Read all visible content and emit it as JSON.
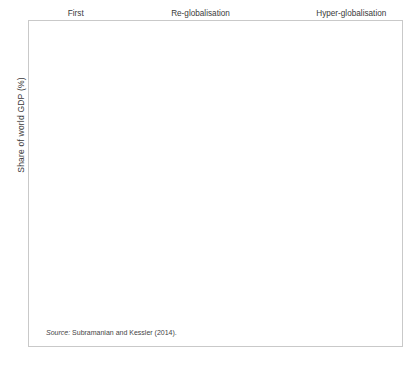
{
  "figure": {
    "source_prefix": "Source:",
    "source_text": " Subramanian and Kessler (2014).",
    "ylabel": "Share of world GDP (%)",
    "bg_color": "#ffffff",
    "frame_color": "#c9c9c9",
    "grid_color": "#b9b9b9",
    "axis_color": "#8a8a8a"
  },
  "eras": [
    {
      "name": "era-first-globalisation",
      "line1": "First",
      "line2": "globalisation",
      "x_center": 1891,
      "divider_year": 1913
    },
    {
      "name": "era-great-reversal",
      "line1": "Great",
      "line2": "Reversal",
      "x_center": 1931,
      "divider_year": 1950
    },
    {
      "name": "era-re-globalisation",
      "line1": "Re-globalisation",
      "line2": "",
      "x_center": 1974,
      "divider_year": 1993.5
    },
    {
      "name": "era-hyper-globalisation",
      "line1": "Hyper-globalisation",
      "line2": "",
      "x_center": 2003,
      "divider_year": null
    }
  ],
  "annotations": [
    {
      "name": "annotation-merchandise-bar",
      "text": "Merchandise",
      "label_x": 141,
      "label_y": 156,
      "arrow_from_x": 136,
      "arrow_from_y": 161,
      "arrow_to_x": 76,
      "arrow_to_y": 200
    },
    {
      "name": "annotation-merchandise-line",
      "text": "",
      "arrow_from_x": 150,
      "arrow_from_y": 163,
      "arrow_to_x": 148,
      "arrow_to_y": 226
    },
    {
      "name": "annotation-merchandise-value-added",
      "line1": "Merchandise",
      "line2": "(value added)",
      "label_x": 204,
      "label_y": 233,
      "arrow_from_x": 200,
      "arrow_from_y": 229,
      "arrow_to_x": 234,
      "arrow_to_y": 222
    },
    {
      "name": "annotation-total",
      "text": "Total",
      "label_x": 330,
      "label_y": 113
    },
    {
      "name": "annotation-total-value-added",
      "line1": "Total",
      "line2": "(value added)",
      "label_x": 365,
      "label_y": 173,
      "arrow_from_x": 362,
      "arrow_from_y": 168,
      "arrow_to_x": 353,
      "arrow_to_y": 143
    },
    {
      "name": "annotation-services",
      "text": "Services",
      "label_x": 347,
      "label_y": 280,
      "arrow_from_x": 345,
      "arrow_from_y": 275,
      "arrow_to_x": 337,
      "arrow_to_y": 262
    }
  ],
  "chart_data": {
    "type": "line",
    "title": "",
    "subtitle": "",
    "xlabel": "",
    "ylabel": "Share of world GDP (%)",
    "ylim": [
      0,
      35
    ],
    "ytick_values": [
      0,
      5,
      10,
      15,
      20,
      25,
      30,
      35
    ],
    "grid": true,
    "legend_position": "inline-annotations",
    "early_categories": [
      "1870",
      "1890",
      "1913",
      "1929",
      "1939",
      "1950"
    ],
    "xtick_labels": [
      "1870",
      "1890",
      "1913",
      "1929",
      "1939",
      "1950",
      "1960",
      "1962",
      "1964",
      "1966",
      "1968",
      "1970",
      "1972",
      "1974",
      "1976",
      "1978",
      "1980",
      "1982",
      "1984",
      "1986",
      "1988",
      "1990",
      "1992",
      "1994",
      "1996",
      "1998",
      "2000",
      "2002",
      "2004",
      "2006",
      "2008",
      "2010"
    ],
    "series": [
      {
        "name": "Merchandise (historical bars)",
        "type": "bar",
        "color": "#7f7f7f",
        "categories": [
          "1870",
          "1890",
          "1913",
          "1929",
          "1939",
          "1950"
        ],
        "values": [
          9.0,
          12.5,
          15.9,
          7.5,
          5.4,
          8.5
        ]
      },
      {
        "name": "Merchandise",
        "type": "line",
        "marker": "x",
        "color": "#8c8c8c",
        "x": [
          1960,
          1961,
          1962,
          1963,
          1964,
          1965,
          1966,
          1967,
          1968,
          1969,
          1970,
          1971,
          1972,
          1973,
          1974,
          1975,
          1976,
          1977,
          1978,
          1979,
          1980,
          1981,
          1982,
          1983,
          1984,
          1985,
          1986,
          1987,
          1988,
          1989,
          1990,
          1991,
          1992,
          1993,
          1994,
          1995,
          1996,
          1997,
          1998,
          1999,
          2000,
          2001,
          2002,
          2003,
          2004,
          2005,
          2006,
          2007,
          2008,
          2009,
          2010
        ],
        "values": [
          9.8,
          9.8,
          9.8,
          9.9,
          10.0,
          10.0,
          10.0,
          9.8,
          10.1,
          10.4,
          10.6,
          11.0,
          11.1,
          12.8,
          15.9,
          15.1,
          15.3,
          15.4,
          15.5,
          16.8,
          18.4,
          17.4,
          16.4,
          16.2,
          16.8,
          16.0,
          14.6,
          15.2,
          16.0,
          16.2,
          16.0,
          15.7,
          15.6,
          15.6,
          16.6,
          17.6,
          17.8,
          18.3,
          18.2,
          18.4,
          19.9,
          19.5,
          19.6,
          20.6,
          22.1,
          23.5,
          24.7,
          25.0,
          26.4,
          21.2,
          26.1
        ]
      },
      {
        "name": "Total",
        "type": "line",
        "marker": "diamond",
        "color": "#000000",
        "x": [
          1980,
          1981,
          1982,
          1983,
          1984,
          1985,
          1986,
          1987,
          1988,
          1989,
          1990,
          1991,
          1992,
          1993,
          1994,
          1995,
          1996,
          1997,
          1998,
          1999,
          2000,
          2001,
          2002,
          2003,
          2004,
          2005,
          2006,
          2007,
          2008,
          2009,
          2010
        ],
        "values": [
          21.8,
          21.2,
          19.6,
          19.3,
          19.9,
          19.2,
          17.8,
          18.5,
          19.4,
          19.7,
          19.2,
          19.1,
          19.2,
          20.2,
          21.3,
          22.4,
          22.5,
          22.9,
          22.6,
          23.0,
          24.5,
          24.2,
          24.6,
          25.5,
          27.2,
          28.8,
          30.2,
          31.0,
          32.8,
          27.8,
          32.2
        ]
      },
      {
        "name": "Total (value added)",
        "type": "line",
        "marker": "star",
        "color": "#1a1a1a",
        "x": [
          1980,
          1981,
          1982,
          1983,
          1984,
          1985,
          1986,
          1987,
          1988,
          1989,
          1990,
          1991,
          1992,
          1993,
          1994,
          1995,
          1996,
          1997,
          1998,
          1999,
          2000,
          2001,
          2002,
          2003,
          2004,
          2005,
          2006,
          2007,
          2008,
          2009,
          2010
        ],
        "values": [
          18.2,
          17.6,
          16.6,
          16.2,
          16.9,
          16.3,
          14.9,
          15.6,
          16.4,
          16.5,
          15.9,
          15.6,
          15.5,
          16.2,
          17.0,
          17.9,
          18.0,
          18.4,
          18.0,
          18.3,
          19.6,
          19.1,
          19.4,
          20.2,
          21.4,
          22.3,
          23.3,
          24.4,
          24.6,
          21.5,
          25.5
        ]
      },
      {
        "name": "Merchandise (value added)",
        "type": "line-dashed",
        "marker": "none",
        "color": "#6f6f6f",
        "x": [
          1970,
          1971,
          1972,
          1973,
          1974,
          1975,
          1976,
          1977,
          1978,
          1979,
          1980,
          1981,
          1982,
          1983,
          1984,
          1985,
          1986,
          1987,
          1988,
          1989,
          1990,
          1991,
          1992,
          1993,
          1994,
          1995,
          1996,
          1997,
          1998,
          1999,
          2000,
          2001,
          2002,
          2003,
          2004,
          2005,
          2006,
          2007,
          2008,
          2009,
          2010
        ],
        "values": [
          8.2,
          8.0,
          8.4,
          9.6,
          10.8,
          10.4,
          11.1,
          11.2,
          11.6,
          12.4,
          13.5,
          12.3,
          11.5,
          11.6,
          11.8,
          11.2,
          10.6,
          10.6,
          10.3,
          10.4,
          9.9,
          9.6,
          9.6,
          10.0,
          10.4,
          11.0,
          10.8,
          11.0,
          10.7,
          10.9,
          11.7,
          11.4,
          11.5,
          12.0,
          12.7,
          13.3,
          14.0,
          14.6,
          14.5,
          12.1,
          14.9
        ]
      },
      {
        "name": "Services",
        "type": "line",
        "marker": "circle",
        "color": "#777777",
        "x": [
          1980,
          1981,
          1982,
          1983,
          1984,
          1985,
          1986,
          1987,
          1988,
          1989,
          1990,
          1991,
          1992,
          1993,
          1994,
          1995,
          1996,
          1997,
          1998,
          1999,
          2000,
          2001,
          2002,
          2003,
          2004,
          2005,
          2006,
          2007,
          2008,
          2009,
          2010
        ],
        "values": [
          3.4,
          3.4,
          3.3,
          3.3,
          3.3,
          3.3,
          3.3,
          3.4,
          3.5,
          3.7,
          3.8,
          3.9,
          4.0,
          4.0,
          4.1,
          4.3,
          4.5,
          4.6,
          4.7,
          4.8,
          4.9,
          5.0,
          5.1,
          5.3,
          5.5,
          5.8,
          6.1,
          6.4,
          6.5,
          6.3,
          6.3
        ]
      }
    ]
  }
}
